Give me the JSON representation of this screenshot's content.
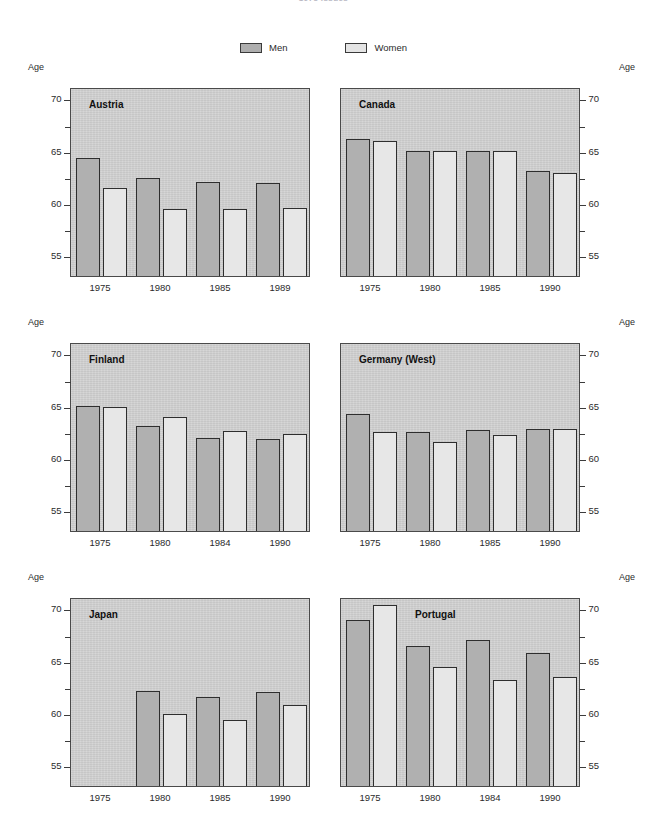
{
  "top_title": "1975 Issues",
  "legend": {
    "entries": [
      {
        "label": "Men",
        "color": "#aeaeae"
      },
      {
        "label": "Women",
        "color": "#e4e4e4"
      }
    ]
  },
  "axis": {
    "age_caption": "Age",
    "major_ticks": [
      "70",
      "65",
      "60",
      "55"
    ],
    "ylim": [
      53.0,
      71.1
    ],
    "tick_values": [
      70,
      65,
      60,
      55
    ],
    "minor_tick_values": [
      67.5,
      62.5,
      57.5
    ]
  },
  "chart_data": {
    "type": "bar",
    "title": "1975 Issues",
    "xlabel": "",
    "ylabel": "Age",
    "ylim": [
      53.0,
      71.1
    ],
    "grid": false,
    "legend_position": "top-center",
    "series_names": [
      "Men",
      "Women"
    ],
    "panels": [
      {
        "country": "Austria",
        "categories": [
          "1975",
          "1980",
          "1985",
          "1989"
        ],
        "series": [
          {
            "name": "Men",
            "values": [
              64.3,
              62.4,
              62.0,
              61.9
            ]
          },
          {
            "name": "Women",
            "values": [
              61.4,
              59.4,
              59.4,
              59.5
            ]
          }
        ]
      },
      {
        "country": "Canada",
        "categories": [
          "1975",
          "1980",
          "1985",
          "1990"
        ],
        "series": [
          {
            "name": "Men",
            "values": [
              66.1,
              65.0,
              65.0,
              63.1
            ]
          },
          {
            "name": "Women",
            "values": [
              65.9,
              65.0,
              65.0,
              62.9
            ]
          }
        ]
      },
      {
        "country": "Finland",
        "categories": [
          "1975",
          "1980",
          "1984",
          "1990"
        ],
        "series": [
          {
            "name": "Men",
            "values": [
              65.0,
              63.1,
              61.9,
              61.8
            ]
          },
          {
            "name": "Women",
            "values": [
              64.9,
              63.9,
              62.6,
              62.3
            ]
          }
        ]
      },
      {
        "country": "Germany (West)",
        "categories": [
          "1975",
          "1980",
          "1985",
          "1990"
        ],
        "series": [
          {
            "name": "Men",
            "values": [
              64.2,
              62.5,
              62.7,
              62.8
            ]
          },
          {
            "name": "Women",
            "values": [
              62.5,
              61.5,
              62.2,
              62.8
            ]
          }
        ]
      },
      {
        "country": "Japan",
        "categories": [
          "1975",
          "1980",
          "1985",
          "1990"
        ],
        "series": [
          {
            "name": "Men",
            "values": [
              null,
              62.1,
              61.5,
              62.0
            ]
          },
          {
            "name": "Women",
            "values": [
              null,
              59.9,
              59.3,
              60.8
            ]
          }
        ]
      },
      {
        "country": "Portugal",
        "categories": [
          "1975",
          "1980",
          "1984",
          "1990"
        ],
        "series": [
          {
            "name": "Men",
            "values": [
              68.9,
              66.4,
              67.0,
              65.7
            ]
          },
          {
            "name": "Women",
            "values": [
              70.3,
              64.4,
              63.2,
              63.4
            ]
          }
        ]
      }
    ]
  }
}
